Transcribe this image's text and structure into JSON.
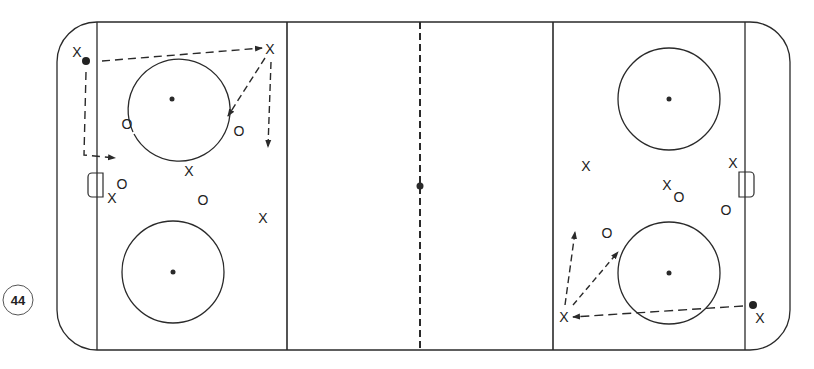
{
  "diagram": {
    "page_number": "44",
    "colors": {
      "line": "#2a2a2a",
      "background": "#ffffff"
    },
    "rink": {
      "zones": [
        "left-defensive-zone",
        "neutral-zone",
        "right-offensive-zone"
      ],
      "faceoff_circles": 4,
      "center_line": "dashed"
    },
    "left_zone_markers": [
      {
        "symbol": "X",
        "x": 77,
        "y": 52
      },
      {
        "symbol": "X",
        "x": 270,
        "y": 52
      },
      {
        "symbol": "O",
        "x": 127,
        "y": 128
      },
      {
        "symbol": "O",
        "x": 239,
        "y": 135
      },
      {
        "symbol": "X",
        "x": 189,
        "y": 174
      },
      {
        "symbol": "O",
        "x": 123,
        "y": 189
      },
      {
        "symbol": "X",
        "x": 112,
        "y": 202
      },
      {
        "symbol": "O",
        "x": 203,
        "y": 204
      },
      {
        "symbol": "X",
        "x": 263,
        "y": 222
      }
    ],
    "right_zone_markers": [
      {
        "symbol": "X",
        "x": 586,
        "y": 170
      },
      {
        "symbol": "X",
        "x": 733,
        "y": 166
      },
      {
        "symbol": "X",
        "x": 667,
        "y": 190
      },
      {
        "symbol": "O",
        "x": 679,
        "y": 201
      },
      {
        "symbol": "O",
        "x": 726,
        "y": 214
      },
      {
        "symbol": "O",
        "x": 607,
        "y": 238
      },
      {
        "symbol": "X",
        "x": 564,
        "y": 320
      },
      {
        "symbol": "X",
        "x": 760,
        "y": 322
      }
    ]
  }
}
